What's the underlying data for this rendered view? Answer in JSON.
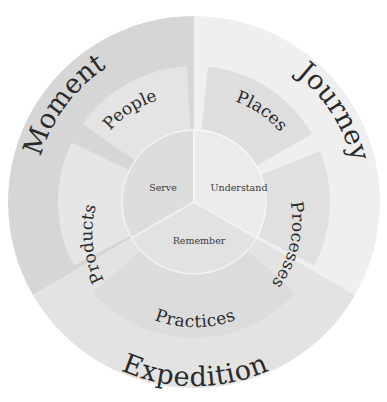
{
  "diagram": {
    "outer": [
      {
        "id": "moment",
        "label": "Moment",
        "color": "#d6d6d6"
      },
      {
        "id": "journey",
        "label": "Journey",
        "color": "#efefef"
      },
      {
        "id": "expedition",
        "label": "Expedition",
        "color": "#e3e3e3"
      }
    ],
    "middle": [
      {
        "id": "people",
        "label": "People",
        "color": "#e4e4e4"
      },
      {
        "id": "places",
        "label": "Places",
        "color": "#dedede"
      },
      {
        "id": "processes",
        "label": "Processes",
        "color": "#e0e0e0"
      },
      {
        "id": "practices",
        "label": "Practices",
        "color": "#dcdcdc"
      },
      {
        "id": "products",
        "label": "Products",
        "color": "#e6e6e6"
      },
      {
        "id": "moment-gap",
        "label": "",
        "color": "#d6d6d6"
      }
    ],
    "inner": [
      {
        "id": "serve",
        "label": "Serve",
        "color": "#dddddd"
      },
      {
        "id": "understand",
        "label": "Understand",
        "color": "#ebebeb"
      },
      {
        "id": "remember",
        "label": "Remember",
        "color": "#e2e2e2"
      }
    ]
  }
}
